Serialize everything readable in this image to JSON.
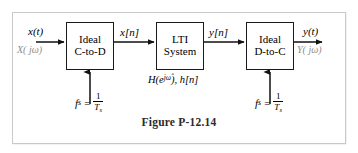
{
  "figure": {
    "caption": "Figure P-12.14",
    "frame_color": "#c9c9c9",
    "line_color": "#1a1a1a",
    "faint_text_color": "#8e8e8e"
  },
  "blocks": [
    {
      "id": "c-to-d",
      "line1": "Ideal",
      "line2": "C-to-D"
    },
    {
      "id": "lti",
      "line1": "LTI",
      "line2": "System"
    },
    {
      "id": "d-to-c",
      "line1": "Ideal",
      "line2": "D-to-C"
    }
  ],
  "signals": {
    "input_time": "x(t)",
    "input_freq": "X( jω)",
    "after_ctod": "x[n]",
    "after_lti": "y[n]",
    "output_time": "y(t)",
    "output_freq": "Y( jω)"
  },
  "system_label": {
    "transfer_function": "H(e",
    "transfer_exponent": "jω̂",
    "transfer_close": "), h[n]"
  },
  "sampling": {
    "left": {
      "symbol": "f",
      "subscript": "s",
      "equals": "=",
      "numerator": "1",
      "denominator": "T",
      "denominator_sub": "s"
    },
    "right": {
      "symbol": "f",
      "subscript": "s",
      "equals": "=",
      "numerator": "1",
      "denominator": "T",
      "denominator_sub": "s"
    }
  }
}
